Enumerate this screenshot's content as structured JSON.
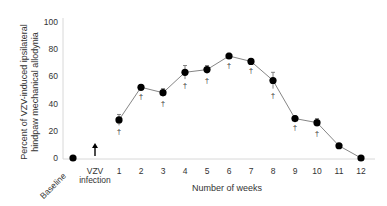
{
  "chart_data": {
    "type": "line",
    "title": "",
    "xlabel": "Number of weeks",
    "ylabel": "Percent of VZV-induced ipsilateral hindpaw mechanical allodynia",
    "ylabel_lines": [
      "Percent of VZV-induced ipsilateral",
      "hindpaw mechanical allodynia"
    ],
    "ylim": [
      0,
      100
    ],
    "yticks": [
      0,
      20,
      40,
      60,
      80,
      100
    ],
    "grid": false,
    "legend": null,
    "categories": [
      "Baseline",
      "VZV infection",
      "1",
      "2",
      "3",
      "4",
      "5",
      "6",
      "7",
      "8",
      "9",
      "10",
      "11",
      "12"
    ],
    "annotations": [
      {
        "text": "VZV infection",
        "type": "arrow",
        "at": "VZV infection"
      },
      {
        "text": "†",
        "meaning": "significance marker",
        "at": [
          "1",
          "2",
          "3",
          "4",
          "5",
          "6",
          "7",
          "8",
          "9",
          "10"
        ]
      }
    ],
    "series": [
      {
        "name": "Allodynia",
        "x": [
          "Baseline",
          "1",
          "2",
          "3",
          "4",
          "5",
          "6",
          "7",
          "8",
          "9",
          "10",
          "11",
          "12"
        ],
        "values": [
          0,
          28,
          52,
          48,
          63,
          65,
          75,
          71,
          57,
          29,
          26,
          9,
          0
        ],
        "errors": [
          0,
          4,
          2,
          3,
          5,
          3,
          2,
          2,
          6,
          2,
          3,
          1,
          0
        ],
        "significant": [
          false,
          true,
          true,
          true,
          true,
          true,
          true,
          true,
          true,
          true,
          true,
          false,
          false
        ]
      }
    ]
  },
  "labels": {
    "y_title_1": "Percent of VZV-induced ipsilateral",
    "y_title_2": "hindpaw mechanical allodynia",
    "x_title": "Number of weeks",
    "baseline": "Baseline",
    "vzv_1": "VZV",
    "vzv_2": "infection",
    "dagger": "†",
    "yticks": [
      "0",
      "20",
      "40",
      "60",
      "80",
      "100"
    ],
    "weeks": [
      "1",
      "2",
      "3",
      "4",
      "5",
      "6",
      "7",
      "8",
      "9",
      "10",
      "11",
      "12"
    ]
  },
  "colors": {
    "marker": "#000000",
    "line": "#777777",
    "axis": "#cccccc",
    "text": "#333333"
  }
}
